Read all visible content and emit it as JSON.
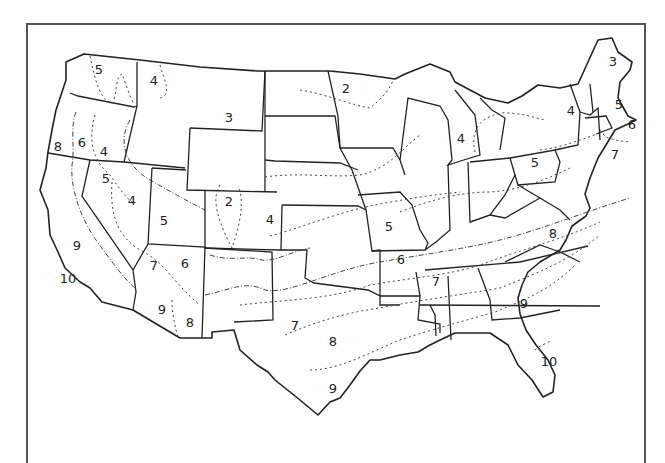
{
  "map": {
    "title": "",
    "subject": "Plant hardiness zones of the contiguous United States",
    "zone_labels": [
      {
        "text": "5",
        "x": 99,
        "y": 69,
        "region": "Washington"
      },
      {
        "text": "4",
        "x": 154,
        "y": 80,
        "region": "Idaho panhandle"
      },
      {
        "text": "3",
        "x": 229,
        "y": 117,
        "region": "Montana"
      },
      {
        "text": "2",
        "x": 346,
        "y": 88,
        "region": "Minnesota"
      },
      {
        "text": "3",
        "x": 613,
        "y": 61,
        "region": "Maine"
      },
      {
        "text": "4",
        "x": 571,
        "y": 110,
        "region": "New York"
      },
      {
        "text": "5",
        "x": 619,
        "y": 104,
        "region": "New Hampshire"
      },
      {
        "text": "6",
        "x": 632,
        "y": 124,
        "region": "Massachusetts coast"
      },
      {
        "text": "4",
        "x": 461,
        "y": 138,
        "region": "Michigan"
      },
      {
        "text": "7",
        "x": 615,
        "y": 154,
        "region": "New Jersey coast"
      },
      {
        "text": "5",
        "x": 535,
        "y": 162,
        "region": "Pennsylvania"
      },
      {
        "text": "8",
        "x": 58,
        "y": 146,
        "region": "Oregon coast"
      },
      {
        "text": "6",
        "x": 82,
        "y": 142,
        "region": "Oregon"
      },
      {
        "text": "4",
        "x": 104,
        "y": 151,
        "region": "Oregon east"
      },
      {
        "text": "5",
        "x": 106,
        "y": 178,
        "region": "Nevada north"
      },
      {
        "text": "4",
        "x": 132,
        "y": 200,
        "region": "Nevada"
      },
      {
        "text": "2",
        "x": 229,
        "y": 201,
        "region": "Colorado Rockies"
      },
      {
        "text": "4",
        "x": 270,
        "y": 219,
        "region": "Colorado east"
      },
      {
        "text": "5",
        "x": 164,
        "y": 220,
        "region": "Utah"
      },
      {
        "text": "5",
        "x": 389,
        "y": 226,
        "region": "Missouri"
      },
      {
        "text": "9",
        "x": 77,
        "y": 245,
        "region": "California central"
      },
      {
        "text": "10",
        "x": 68,
        "y": 278,
        "region": "California south coast"
      },
      {
        "text": "7",
        "x": 154,
        "y": 265,
        "region": "Arizona north"
      },
      {
        "text": "6",
        "x": 185,
        "y": 263,
        "region": "Arizona plateau"
      },
      {
        "text": "6",
        "x": 401,
        "y": 259,
        "region": "Arkansas"
      },
      {
        "text": "8",
        "x": 553,
        "y": 233,
        "region": "North Carolina"
      },
      {
        "text": "7",
        "x": 436,
        "y": 281,
        "region": "Mississippi north"
      },
      {
        "text": "9",
        "x": 524,
        "y": 303,
        "region": "Georgia"
      },
      {
        "text": "9",
        "x": 162,
        "y": 309,
        "region": "Arizona south"
      },
      {
        "text": "8",
        "x": 190,
        "y": 322,
        "region": "Arizona southeast"
      },
      {
        "text": "7",
        "x": 295,
        "y": 325,
        "region": "Texas panhandle"
      },
      {
        "text": "8",
        "x": 333,
        "y": 341,
        "region": "Texas central"
      },
      {
        "text": "10",
        "x": 549,
        "y": 361,
        "region": "Florida"
      },
      {
        "text": "9",
        "x": 333,
        "y": 388,
        "region": "Texas south"
      }
    ]
  }
}
